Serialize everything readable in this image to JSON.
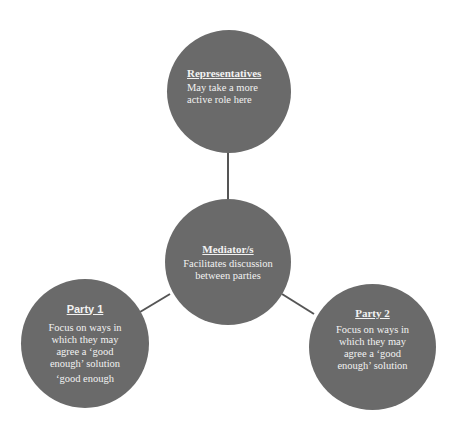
{
  "diagram": {
    "type": "hub-and-spoke",
    "colors": {
      "node_fill": "#6a6a6a",
      "node_text": "#f2f2f2",
      "connector": "#555555",
      "background": "#ffffff"
    },
    "nodes": {
      "representatives": {
        "title": "Representatives",
        "body": "May take a more active role here"
      },
      "mediator": {
        "title": "Mediator/s",
        "body": "Facilitates discussion between parties"
      },
      "party1": {
        "title": "Party 1",
        "body": "Focus on ways in which they may agree a ‘good enough’ solution",
        "extra": "‘good enough"
      },
      "party2": {
        "title": "Party 2",
        "body": "Focus on ways in which they may agree a ‘good enough’ solution"
      }
    },
    "edges": [
      {
        "from": "mediator",
        "to": "representatives"
      },
      {
        "from": "mediator",
        "to": "party1"
      },
      {
        "from": "mediator",
        "to": "party2"
      }
    ]
  }
}
